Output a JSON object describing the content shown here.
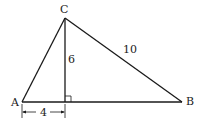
{
  "diagram": {
    "type": "right-triangle-geometry",
    "vertices": [
      {
        "id": "A",
        "label": "A",
        "x": 22,
        "y": 102,
        "label_x": 12,
        "label_y": 106
      },
      {
        "id": "B",
        "label": "B",
        "x": 182,
        "y": 102,
        "label_x": 186,
        "label_y": 104
      },
      {
        "id": "C",
        "label": "C",
        "x": 65,
        "y": 18,
        "label_x": 60,
        "label_y": 13
      }
    ],
    "foot": {
      "x": 65,
      "y": 102
    },
    "measurements": {
      "altitude": {
        "label": "6",
        "x": 69,
        "y": 64
      },
      "hypotenuse_cb": {
        "label": "10",
        "x": 120,
        "y": 55
      },
      "segment_a_foot": {
        "label": "4",
        "x": 40,
        "y": 116
      }
    },
    "right_angle_marker": true
  }
}
